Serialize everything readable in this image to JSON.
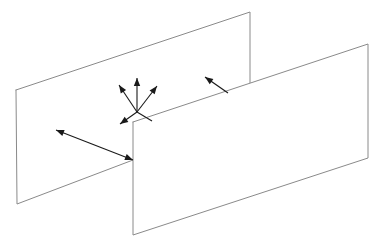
{
  "figure": {
    "background_color": "#ffffff",
    "width": 380,
    "height": 250,
    "line_color": "#8a8a8a",
    "arrow_color": "#1a1a1a",
    "plane_fill": "#ffffff",
    "plane_stroke_width": 1,
    "arrow_stroke_width": 1.1
  },
  "planes": [
    {
      "name": "back-plane",
      "label": "back-left vertical plane",
      "points": "16,90 250,12 250,88 133,160 17,204",
      "outline": "16,90 250,12 250,88 133,160 17,204 16,90",
      "corners": [
        {
          "name": "top-left",
          "x": 16,
          "y": 90
        },
        {
          "name": "top-right",
          "x": 250,
          "y": 12
        },
        {
          "name": "bottom-right",
          "x": 250,
          "y": 88
        },
        {
          "name": "intersection",
          "x": 133,
          "y": 160
        },
        {
          "name": "bottom-left",
          "x": 17,
          "y": 204
        }
      ]
    },
    {
      "name": "front-plane",
      "label": "front-right vertical plane",
      "points": "133,122 368,44 368,158 133,235",
      "outline": "133,122 368,44 368,158 133,235 133,122",
      "corners": [
        {
          "name": "top-left",
          "x": 133,
          "y": 122
        },
        {
          "name": "top-right",
          "x": 368,
          "y": 44
        },
        {
          "name": "bottom-right",
          "x": 368,
          "y": 158
        },
        {
          "name": "bottom-left",
          "x": 133,
          "y": 235
        }
      ]
    }
  ],
  "arrow_star": {
    "name": "scattering-arrow-star",
    "label": "radiating scattering directions",
    "center": {
      "x": 137,
      "y": 112
    },
    "rays": [
      {
        "name": "ray-up",
        "x1": 137,
        "y1": 112,
        "x2": 137,
        "y2": 78,
        "head": true
      },
      {
        "name": "ray-upper-left",
        "x1": 137,
        "y1": 112,
        "x2": 119,
        "y2": 85,
        "head": true
      },
      {
        "name": "ray-upper-right",
        "x1": 137,
        "y1": 112,
        "x2": 157,
        "y2": 86,
        "head": true
      },
      {
        "name": "ray-lower-left",
        "x1": 137,
        "y1": 112,
        "x2": 120,
        "y2": 124,
        "head": true
      },
      {
        "name": "ray-lower-right",
        "x1": 137,
        "y1": 112,
        "x2": 152,
        "y2": 121,
        "head": false
      }
    ]
  },
  "arrows": [
    {
      "name": "double-arrow-left",
      "label": "double-headed arrow across back plane",
      "x1": 133,
      "y1": 160,
      "x2": 56,
      "y2": 130,
      "head_start": true,
      "head_end": true
    },
    {
      "name": "arrow-upper-right",
      "label": "arrow pointing up-left from front plane top edge",
      "x1": 228,
      "y1": 93,
      "x2": 205,
      "y2": 77,
      "head_start": false,
      "head_end": true
    }
  ]
}
